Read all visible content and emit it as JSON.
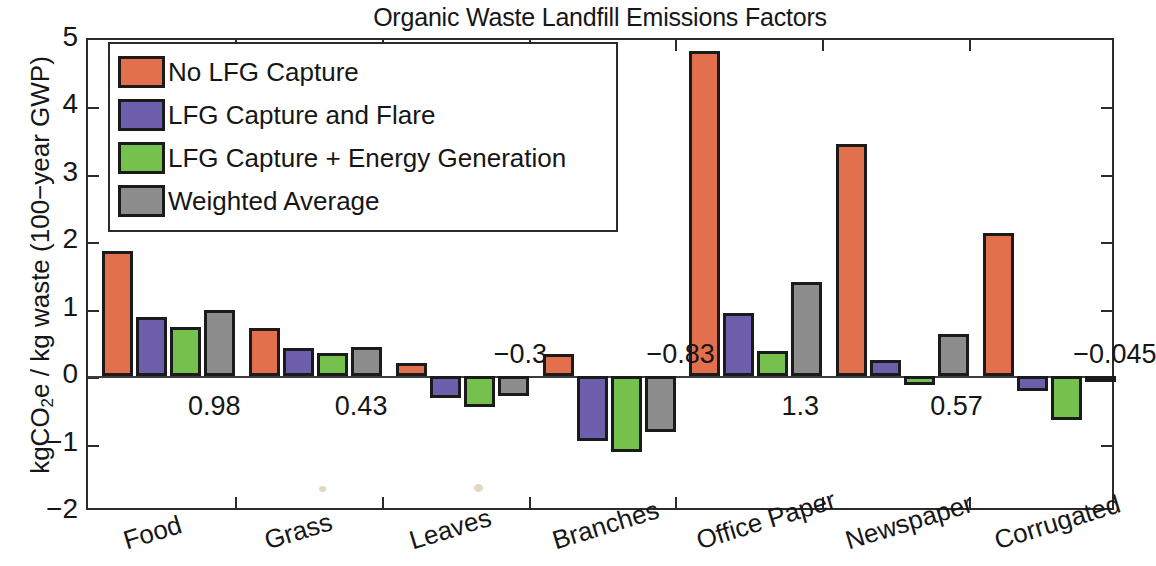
{
  "chart_data": {
    "type": "bar",
    "title": "Organic Waste Landfill Emissions Factors",
    "xlabel": "",
    "ylabel": "kgCO2e / kg waste (100−year GWP)",
    "ylim": [
      -2,
      5
    ],
    "ytick_labels": [
      "5",
      "4",
      "3",
      "2",
      "1",
      "0",
      "−1",
      "−2"
    ],
    "ytick_values": [
      5,
      4,
      3,
      2,
      1,
      0,
      -1,
      -2
    ],
    "grid": false,
    "legend_position": "upper left",
    "categories": [
      "Food",
      "Grass",
      "Leaves",
      "Branches",
      "Office Paper",
      "Newspaper",
      "Corrugated"
    ],
    "series": [
      {
        "name": "No LFG Capture",
        "color": "#e3704c",
        "values": [
          1.85,
          0.72,
          0.19,
          0.33,
          4.82,
          3.45,
          2.13
        ]
      },
      {
        "name": "LFG Capture and Flare",
        "color": "#6d5fab",
        "values": [
          0.88,
          0.42,
          -0.32,
          -0.96,
          0.94,
          0.24,
          -0.22
        ]
      },
      {
        "name": "LFG Capture + Energy Generation",
        "color": "#76c04d",
        "values": [
          0.73,
          0.35,
          -0.46,
          -1.12,
          0.38,
          -0.13,
          -0.65
        ]
      },
      {
        "name": "Weighted Average",
        "color": "#8d8d8d",
        "values": [
          0.98,
          0.43,
          -0.3,
          -0.83,
          1.4,
          0.62,
          -0.045
        ]
      }
    ],
    "annotations": [
      {
        "category": "Food",
        "label": "0.98",
        "value": 0.98
      },
      {
        "category": "Grass",
        "label": "0.43",
        "value": 0.43
      },
      {
        "category": "Leaves",
        "label": "−0.3",
        "value": -0.3
      },
      {
        "category": "Branches",
        "label": "−0.83",
        "value": -0.83
      },
      {
        "category": "Office Paper",
        "label": "1.3",
        "value": 1.3
      },
      {
        "category": "Newspaper",
        "label": "0.57",
        "value": 0.57
      },
      {
        "category": "Corrugated",
        "label": "−0.045",
        "value": -0.045
      }
    ]
  },
  "title": {
    "text": "Organic Waste Landfill Emissions Factors"
  },
  "axes": {
    "y_label_main": "kgCO",
    "y_label_sub": "2",
    "y_label_rest": "e / kg waste (100−year GWP)"
  },
  "legend": {
    "items": [
      {
        "label": "No LFG Capture",
        "color": "#e3704c"
      },
      {
        "label": "LFG Capture and Flare",
        "color": "#6d5fab"
      },
      {
        "label": "LFG Capture + Energy Generation",
        "color": "#76c04d"
      },
      {
        "label": "Weighted Average",
        "color": "#8d8d8d"
      }
    ]
  }
}
